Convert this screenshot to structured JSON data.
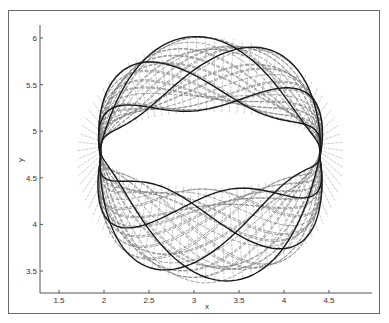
{
  "chart_data": {
    "type": "line",
    "title": "",
    "xlabel": "x",
    "ylabel": "y",
    "xlim": [
      1.3,
      5.0
    ],
    "ylim": [
      3.25,
      6.25
    ],
    "x_ticks": [
      1.5,
      2,
      2.5,
      3,
      3.5,
      4,
      4.5
    ],
    "x_tick_labels": [
      "1.5",
      "2",
      "2.5",
      "3",
      "3.5",
      "4",
      "4.5"
    ],
    "y_ticks": [
      3.5,
      4,
      4.5,
      5,
      5.5,
      6
    ],
    "y_tick_labels": [
      "3.5",
      "4",
      "4.5",
      "5",
      "5.5",
      "6"
    ],
    "grid": false,
    "legend": null,
    "annulus": {
      "center": [
        3.18,
        4.8
      ],
      "outer_extent": {
        "x": [
          1.65,
          4.7
        ],
        "y": [
          3.35,
          6.05
        ]
      },
      "inner_hole": {
        "x": [
          2.0,
          4.4
        ],
        "y": [
          4.4,
          5.2
        ]
      }
    },
    "series": [
      {
        "name": "background orbits",
        "style": "dashed",
        "color": "#7a7a7a",
        "count": 70
      },
      {
        "name": "highlighted trajectory",
        "style": "solid",
        "color": "#1a1a1a",
        "count": 8
      }
    ],
    "key_points": [
      {
        "x": 2.0,
        "y": 4.75,
        "label": "left crossing"
      },
      {
        "x": 4.35,
        "y": 4.75,
        "label": "right crossing"
      }
    ]
  }
}
